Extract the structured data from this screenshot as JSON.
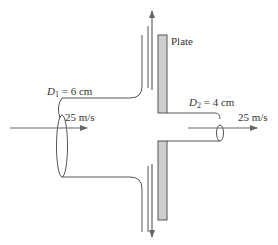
{
  "diagram": {
    "type": "fluid-jet-impinging-on-plate-with-hole",
    "colors": {
      "line": "#555555",
      "plate_fill": "#cfcfcf",
      "plate_stroke": "#555555",
      "text": "#333333"
    },
    "labels": {
      "plate": "Plate",
      "d1_symbol": "D",
      "d1_sub": "1",
      "d1_value": " = 6 cm",
      "d2_symbol": "D",
      "d2_sub": "2",
      "d2_value": " = 4 cm",
      "inlet_velocity": "25 m/s",
      "outlet_velocity": "25 m/s"
    },
    "nodes": [
      {
        "id": "inlet-jet",
        "label": "D1 = 6 cm, 25 m/s"
      },
      {
        "id": "plate",
        "label": "Plate"
      },
      {
        "id": "outlet-jet",
        "label": "D2 = 4 cm, 25 m/s"
      },
      {
        "id": "deflected-flow-up",
        "label": ""
      },
      {
        "id": "deflected-flow-down",
        "label": ""
      }
    ],
    "edges": [
      {
        "from": "inlet-jet",
        "to": "plate",
        "direction": "right"
      },
      {
        "from": "plate",
        "to": "outlet-jet",
        "direction": "right"
      },
      {
        "from": "plate",
        "to": "deflected-flow-up",
        "direction": "up"
      },
      {
        "from": "plate",
        "to": "deflected-flow-down",
        "direction": "down"
      }
    ]
  }
}
